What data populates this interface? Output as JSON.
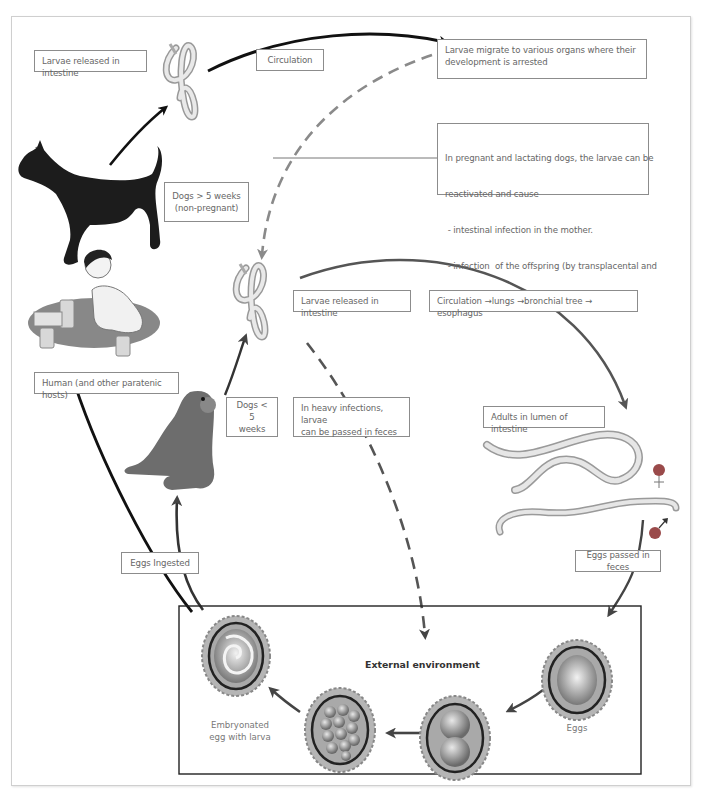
{
  "diagram": {
    "title_box": "External environment",
    "labels": {
      "larvae_released_top": "Larvae released in intestine",
      "circulation": "Circulation",
      "larvae_migrate": [
        "Larvae migrate to various organs  where their",
        "development is arrested"
      ],
      "pregnant_note": [
        "In pregnant and lactating dogs, the larvae can be",
        "reactivated and cause",
        " - intestinal infection in the mother.",
        " - infection  of the offspring (by transplacental and",
        "   transmammary transmission)"
      ],
      "dogs_over_5": [
        "Dogs > 5 weeks",
        "(non-pregnant)"
      ],
      "larvae_released_mid": "Larvae released in intestine",
      "circulation_route": "Circulation →lungs →bronchial tree → esophagus",
      "human_hosts": "Human (and other paratenic hosts)",
      "dogs_under_5": [
        "Dogs < 5",
        "weeks"
      ],
      "heavy_infections": [
        "In heavy infections, larvae",
        "can be passed in feces"
      ],
      "adults_lumen": "Adults in lumen of intestine",
      "female_symbol": "♀",
      "male_symbol": "♂",
      "eggs_ingested": "Eggs Ingested",
      "eggs_passed": "Eggs passed in feces",
      "embryonated": [
        "Embryonated",
        "egg with larva"
      ],
      "eggs": "Eggs"
    },
    "colors": {
      "arrow_black": "#111111",
      "arrow_gray": "#555555",
      "dashed_gray": "#8a8a8a",
      "female_dot": "#9a4a4a",
      "male_dot": "#9a4a4a",
      "egg_shell": "#a8a8a8",
      "worm": "#d8d8d8"
    }
  }
}
